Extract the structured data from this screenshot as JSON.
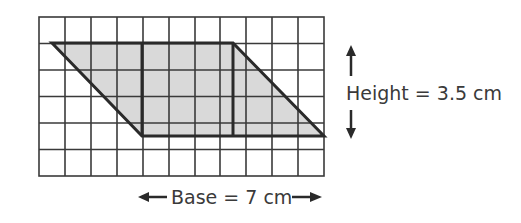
{
  "figure": {
    "shape": "parallelogram",
    "grid": {
      "columns": 11,
      "rows": 6
    },
    "colors": {
      "fill": "#d9d9d9",
      "line": "#333333",
      "grid": "#3a3a3a",
      "text": "#3a3a3a"
    }
  },
  "labels": {
    "height": "Height = 3.5 cm",
    "base": "Base = 7 cm"
  },
  "icons": {
    "height_up": "arrow-up-icon",
    "height_down": "arrow-down-icon",
    "base_left": "arrow-left-icon",
    "base_right": "arrow-right-icon"
  }
}
